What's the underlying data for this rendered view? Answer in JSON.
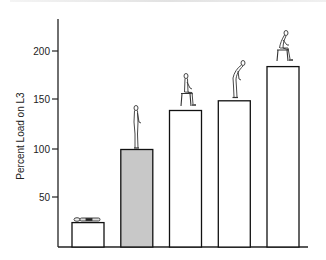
{
  "chart_data": {
    "type": "bar",
    "title": "",
    "xlabel": "",
    "ylabel": "Percent Load on L3",
    "ylim": [
      0,
      230
    ],
    "yticks": [
      50,
      100,
      150,
      200
    ],
    "grid": false,
    "legend": null,
    "categories": [
      "Lying supine",
      "Standing upright",
      "Sitting upright",
      "Standing bent forward",
      "Sitting bent forward"
    ],
    "values": [
      25,
      100,
      140,
      150,
      185
    ],
    "bar_colors": [
      "#ffffff",
      "#c8c8c8",
      "#ffffff",
      "#ffffff",
      "#ffffff"
    ],
    "highlighted_category": "Standing upright",
    "annotations": [
      {
        "bar": 0,
        "pictogram": "figure-lying"
      },
      {
        "bar": 1,
        "pictogram": "figure-standing"
      },
      {
        "bar": 2,
        "pictogram": "figure-sitting-upright"
      },
      {
        "bar": 3,
        "pictogram": "figure-standing-bent"
      },
      {
        "bar": 4,
        "pictogram": "figure-sitting-bent"
      }
    ]
  },
  "axis": {
    "ylabel": "Percent Load on L3",
    "tick_labels": [
      "200",
      "150",
      "100",
      "50"
    ]
  },
  "colors": {
    "axis": "#222222",
    "bar_outline": "#111111",
    "highlight_fill": "#c8c8c8"
  }
}
